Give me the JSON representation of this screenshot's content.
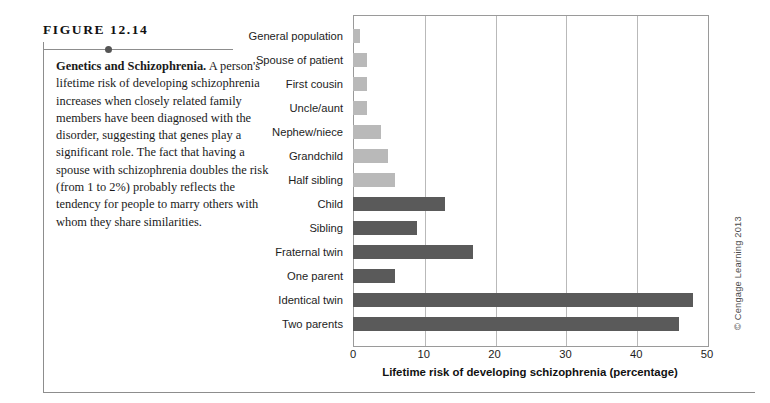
{
  "figure": {
    "label_prefix": "F",
    "label_word": "IGURE",
    "number": "12.14",
    "label_full": "FIGURE 12.14",
    "caption_title": "Genetics and Schizophrenia.",
    "caption_body": "A person's lifetime risk of developing schizophrenia increases when closely related family members have been diagnosed with the disorder, suggesting that genes play a significant role. The fact that having a spouse with schizophrenia doubles the risk (from 1 to 2%) probably reflects the tendency for people to marry others with whom they share similarities."
  },
  "copyright": "© Cengage Learning 2013",
  "colors": {
    "bar_light": "#b9b9b9",
    "bar_dark": "#5a5a5a",
    "gridline": "#b9b9b9",
    "axis": "#9a9a9a",
    "rule": "#8d8d8d"
  },
  "chart_data": {
    "type": "bar",
    "orientation": "horizontal",
    "title": "",
    "xlabel": "Lifetime risk of developing schizophrenia (percentage)",
    "ylabel": "",
    "xlim": [
      0,
      50
    ],
    "xticks": [
      0,
      10,
      20,
      30,
      40,
      50
    ],
    "grid": true,
    "legend": "none",
    "categories": [
      "General population",
      "Spouse of patient",
      "First cousin",
      "Uncle/aunt",
      "Nephew/niece",
      "Grandchild",
      "Half sibling",
      "Child",
      "Sibling",
      "Fraternal twin",
      "One parent",
      "Identical twin",
      "Two parents"
    ],
    "values": [
      1,
      2,
      2,
      2,
      4,
      5,
      6,
      13,
      9,
      17,
      6,
      48,
      46
    ],
    "bar_shades": [
      "light",
      "light",
      "light",
      "light",
      "light",
      "light",
      "light",
      "dark",
      "dark",
      "dark",
      "dark",
      "dark",
      "dark"
    ]
  }
}
